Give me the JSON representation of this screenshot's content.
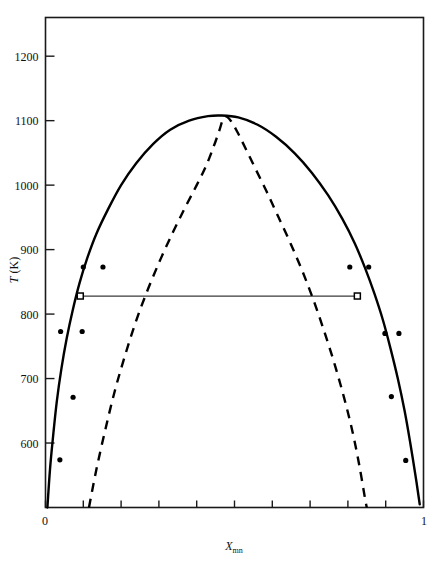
{
  "figure": {
    "name": "binary-miscibility-gap-phase-diagram",
    "background": "#ffffff",
    "frame_color": "#1a1a1a"
  },
  "axes": {
    "y_title_main": "T",
    "y_title_unit": " (K)",
    "x_title_main": "X",
    "x_title_sub": "mn",
    "y_ticks": [
      600,
      700,
      800,
      900,
      1000,
      1100,
      1200
    ],
    "y_tick_labels": [
      "600",
      "700",
      "800",
      "900",
      "1000",
      "1100",
      "1200"
    ],
    "x_ticks": [
      0,
      0.1,
      0.2,
      0.3,
      0.4,
      0.5,
      0.6,
      0.7,
      0.8,
      0.9,
      1
    ],
    "x_tick_labels_shown": [
      "0",
      "1"
    ],
    "x_label_left": "0",
    "x_label_right": "1",
    "ylim": [
      500,
      1260
    ],
    "xlim": [
      0,
      1
    ]
  },
  "chart_data": {
    "type": "line",
    "title": "",
    "xlabel": "X_mn",
    "ylabel": "T (K)",
    "xlim": [
      0,
      1
    ],
    "ylim": [
      500,
      1260
    ],
    "grid": false,
    "legend_position": "none",
    "series": [
      {
        "name": "binodal-solid-curve",
        "style": "solid",
        "color": "#000000",
        "width": 2.4,
        "points": [
          [
            0.005,
            500
          ],
          [
            0.012,
            560
          ],
          [
            0.02,
            610
          ],
          [
            0.03,
            665
          ],
          [
            0.042,
            715
          ],
          [
            0.056,
            762
          ],
          [
            0.072,
            806
          ],
          [
            0.09,
            848
          ],
          [
            0.11,
            886
          ],
          [
            0.135,
            925
          ],
          [
            0.165,
            962
          ],
          [
            0.2,
            1000
          ],
          [
            0.24,
            1034
          ],
          [
            0.285,
            1064
          ],
          [
            0.33,
            1086
          ],
          [
            0.38,
            1100
          ],
          [
            0.43,
            1107
          ],
          [
            0.465,
            1108
          ],
          [
            0.51,
            1105
          ],
          [
            0.56,
            1094
          ],
          [
            0.61,
            1075
          ],
          [
            0.66,
            1049
          ],
          [
            0.705,
            1019
          ],
          [
            0.748,
            984
          ],
          [
            0.785,
            948
          ],
          [
            0.818,
            910
          ],
          [
            0.845,
            872
          ],
          [
            0.87,
            832
          ],
          [
            0.893,
            790
          ],
          [
            0.913,
            746
          ],
          [
            0.932,
            700
          ],
          [
            0.95,
            650
          ],
          [
            0.965,
            600
          ],
          [
            0.98,
            545
          ],
          [
            0.99,
            505
          ]
        ]
      },
      {
        "name": "spinodal-dashed-curve",
        "style": "dashed",
        "color": "#000000",
        "width": 2.4,
        "dash": "9,7",
        "points": [
          [
            0.115,
            500
          ],
          [
            0.135,
            560
          ],
          [
            0.158,
            620
          ],
          [
            0.183,
            680
          ],
          [
            0.21,
            735
          ],
          [
            0.24,
            790
          ],
          [
            0.272,
            840
          ],
          [
            0.305,
            886
          ],
          [
            0.338,
            928
          ],
          [
            0.37,
            966
          ],
          [
            0.4,
            1000
          ],
          [
            0.425,
            1030
          ],
          [
            0.445,
            1060
          ],
          [
            0.46,
            1085
          ],
          [
            0.468,
            1100
          ],
          [
            0.475,
            1107
          ],
          [
            0.49,
            1100
          ],
          [
            0.508,
            1082
          ],
          [
            0.53,
            1056
          ],
          [
            0.555,
            1026
          ],
          [
            0.585,
            990
          ],
          [
            0.615,
            952
          ],
          [
            0.648,
            910
          ],
          [
            0.68,
            866
          ],
          [
            0.71,
            820
          ],
          [
            0.738,
            772
          ],
          [
            0.765,
            722
          ],
          [
            0.79,
            670
          ],
          [
            0.812,
            618
          ],
          [
            0.83,
            566
          ],
          [
            0.845,
            515
          ],
          [
            0.85,
            500
          ]
        ]
      }
    ],
    "scatter_series": [
      {
        "name": "experimental-points-filled-circles",
        "marker": "filled-circle",
        "color": "#000000",
        "size": 5.2,
        "points": [
          [
            0.038,
            574
          ],
          [
            0.073,
            671
          ],
          [
            0.04,
            773
          ],
          [
            0.097,
            773
          ],
          [
            0.1,
            873
          ],
          [
            0.152,
            873
          ],
          [
            0.805,
            873
          ],
          [
            0.855,
            873
          ],
          [
            0.898,
            770
          ],
          [
            0.935,
            770
          ],
          [
            0.915,
            672
          ],
          [
            0.953,
            573
          ]
        ]
      },
      {
        "name": "tie-line-endpoint-open-squares",
        "marker": "open-square",
        "color": "#000000",
        "size": 6.0,
        "points": [
          [
            0.092,
            828
          ],
          [
            0.825,
            828
          ]
        ]
      }
    ],
    "annotations": [
      {
        "name": "tie-line",
        "type": "horizontal-segment",
        "y": 828,
        "x_start": 0.092,
        "x_end": 0.825,
        "color": "#3a3a3a",
        "width": 1.2
      }
    ]
  }
}
